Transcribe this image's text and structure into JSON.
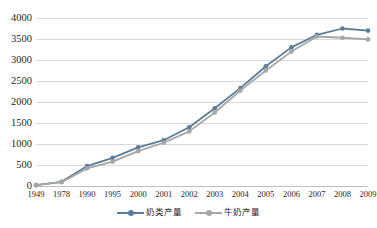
{
  "chart_data": {
    "type": "line",
    "title": "",
    "xlabel": "",
    "ylabel": "",
    "ylim": [
      0,
      4000
    ],
    "ytick_step": 500,
    "yticks": [
      "0",
      "500",
      "1000",
      "1500",
      "2000",
      "2500",
      "3000",
      "3500",
      "4000"
    ],
    "grid": "horizontal",
    "legend_position": "bottom-center",
    "categories": [
      "1949",
      "1978",
      "1990",
      "1995",
      "2000",
      "2001",
      "2002",
      "2003",
      "2004",
      "2005",
      "2006",
      "2007",
      "2008",
      "2009"
    ],
    "series": [
      {
        "name": "奶类产量",
        "color": "#5b7c99",
        "marker": "circle",
        "values": [
          20,
          100,
          475,
          670,
          920,
          1090,
          1400,
          1850,
          2330,
          2850,
          3300,
          3600,
          3750,
          3700
        ]
      },
      {
        "name": "牛奶产量",
        "color": "#a6a6a6",
        "marker": "circle",
        "values": [
          20,
          90,
          420,
          580,
          830,
          1030,
          1300,
          1750,
          2270,
          2750,
          3200,
          3560,
          3530,
          3490
        ]
      }
    ]
  },
  "legend": {
    "entries": [
      {
        "label": "奶类产量"
      },
      {
        "label": "牛奶产量"
      }
    ]
  },
  "colors": {
    "series_1": "#5b7c99",
    "series_2": "#a6a6a6",
    "gridline": "#d9d9d9",
    "text": "#1f1f1f",
    "background": "#ffffff"
  }
}
